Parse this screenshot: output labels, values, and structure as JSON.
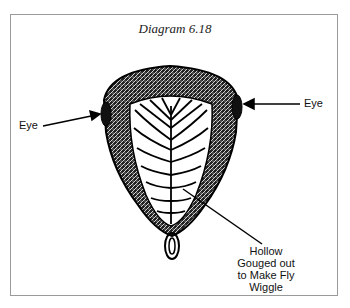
{
  "title": "Diagram 6.18",
  "labels": {
    "eye_left": "Eye",
    "eye_right": "Eye",
    "hollow_line1": "Hollow",
    "hollow_line2": "Gouged out",
    "hollow_line3": "to Make Fly",
    "hollow_line4": "Wiggle"
  }
}
